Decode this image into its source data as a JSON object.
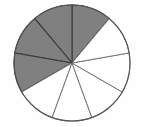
{
  "figure": {
    "name": "fraction-circle",
    "background_color": "#fefefe"
  },
  "chart_data": {
    "type": "pie",
    "title": "",
    "subtitle": "",
    "xlabel": "",
    "ylabel": "",
    "legend": [],
    "annotations": [],
    "grid": false,
    "total_slices": 9,
    "slice_angle_degrees": 40,
    "shaded_count": 4,
    "unshaded_count": 5,
    "fraction_shaded": "4/9",
    "categories": [
      "slice-1",
      "slice-2",
      "slice-3",
      "slice-4",
      "slice-5",
      "slice-6",
      "slice-7",
      "slice-8",
      "slice-9"
    ],
    "values": [
      40,
      40,
      40,
      40,
      40,
      40,
      40,
      40,
      40
    ],
    "series": [
      {
        "name": "shaded",
        "values": [
          1,
          1,
          1,
          1,
          0,
          0,
          0,
          0,
          0
        ]
      }
    ],
    "colors": {
      "shaded": "#808080",
      "unshaded": "#ffffff",
      "outline": "#555555",
      "divider": "#3a3a3a"
    },
    "geometry": {
      "center_x": 72,
      "center_y": 63,
      "radius_x": 58,
      "radius_y": 58,
      "start_angle_degrees": -90,
      "direction": "clockwise"
    },
    "slices": [
      {
        "index": 1,
        "label": "slice-1",
        "start_deg": -90,
        "end_deg": -50,
        "shaded": true
      },
      {
        "index": 2,
        "label": "slice-2",
        "start_deg": -130,
        "end_deg": -90,
        "shaded": true
      },
      {
        "index": 3,
        "label": "slice-3",
        "start_deg": -170,
        "end_deg": -130,
        "shaded": true
      },
      {
        "index": 4,
        "label": "slice-4",
        "start_deg": -210,
        "end_deg": -170,
        "shaded": true
      },
      {
        "index": 5,
        "label": "slice-5",
        "start_deg": -250,
        "end_deg": -210,
        "shaded": false
      },
      {
        "index": 6,
        "label": "slice-6",
        "start_deg": -290,
        "end_deg": -250,
        "shaded": false
      },
      {
        "index": 7,
        "label": "slice-7",
        "start_deg": -330,
        "end_deg": -290,
        "shaded": false
      },
      {
        "index": 8,
        "label": "slice-8",
        "start_deg": -370,
        "end_deg": -330,
        "shaded": false
      },
      {
        "index": 9,
        "label": "slice-9",
        "start_deg": -410,
        "end_deg": -370,
        "shaded": false
      }
    ]
  }
}
